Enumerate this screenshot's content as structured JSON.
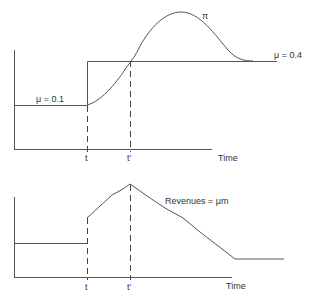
{
  "top_panel": {
    "labels": {
      "mu_low": "μ = 0.1",
      "mu_high": "μ = 0.4",
      "profit_curve": "π",
      "tick_t": "t",
      "tick_t_prime": "t′",
      "x_axis": "Time"
    }
  },
  "bottom_panel": {
    "labels": {
      "revenue_curve": "Revenues = μm",
      "tick_t": "t",
      "tick_t_prime": "t′",
      "x_axis": "Time"
    }
  },
  "colors": {
    "line": "#555555",
    "text": "#333333"
  }
}
